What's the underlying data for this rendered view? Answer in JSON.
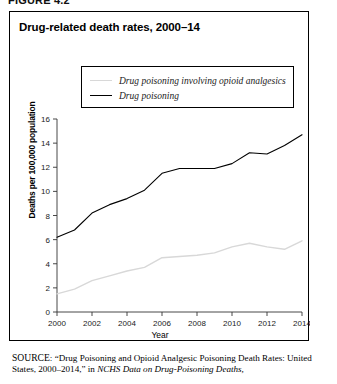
{
  "figure": {
    "label": "FIGURE 4.2"
  },
  "chart_title": "Drug-related death rates, 2000–14",
  "legend": {
    "position": "top-center-inside",
    "items": [
      {
        "label": "Drug poisoning involving opioid analgesics",
        "color": "#d8d8d8"
      },
      {
        "label": "Drug poisoning",
        "color": "#000000"
      }
    ]
  },
  "axes": {
    "ylabel": "Deaths per 100,000 population",
    "xlabel": "Year",
    "yticks": [
      "0",
      "2",
      "4",
      "6",
      "8",
      "10",
      "12",
      "14",
      "16"
    ],
    "xticks": [
      "2000",
      "2002",
      "2004",
      "2006",
      "2008",
      "2010",
      "2012",
      "2014"
    ]
  },
  "source": {
    "prefix": "SOURCE",
    "line1_a": ": “Drug Poisoning and Opioid Analgesic Poisoning Death Rates:",
    "line2_a": "United States, 2000–2014,” in ",
    "line2_italic": "NCHS Data on Drug-Poisoning Deaths,",
    "line3": ""
  },
  "chart_data": {
    "type": "line",
    "title": "Drug-related death rates, 2000–14",
    "xlabel": "Year",
    "ylabel": "Deaths per 100,000 population",
    "xlim": [
      2000,
      2014
    ],
    "ylim": [
      0,
      16
    ],
    "grid": false,
    "legend_position": "upper center",
    "x": [
      2000,
      2001,
      2002,
      2003,
      2004,
      2005,
      2006,
      2007,
      2008,
      2009,
      2010,
      2011,
      2012,
      2013,
      2014
    ],
    "series": [
      {
        "name": "Drug poisoning",
        "color": "#000000",
        "values": [
          6.2,
          6.8,
          8.2,
          8.9,
          9.4,
          10.1,
          11.5,
          11.9,
          11.9,
          11.9,
          12.3,
          13.2,
          13.1,
          13.8,
          14.7
        ]
      },
      {
        "name": "Drug poisoning involving opioid analgesics",
        "color": "#d8d8d8",
        "values": [
          1.5,
          1.9,
          2.6,
          3.0,
          3.4,
          3.7,
          4.5,
          4.6,
          4.7,
          4.9,
          5.4,
          5.7,
          5.4,
          5.2,
          5.9
        ]
      }
    ]
  }
}
